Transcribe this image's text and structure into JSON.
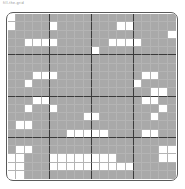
{
  "caption": {
    "text": "fill-the-grid"
  },
  "grid": {
    "columns": 20,
    "rows": 20,
    "block_size": 5,
    "filled_color": "#a9a9a9",
    "empty_color": "#ffffff",
    "gridline_color": "#b4b4b4",
    "block_line_color": "#3a3a3a",
    "border_color": "#5a5a5a",
    "cells": [
      [
        0,
        1,
        1,
        1,
        1,
        1,
        1,
        1,
        1,
        1,
        1,
        1,
        1,
        1,
        1,
        1,
        1,
        1,
        1,
        1
      ],
      [
        0,
        1,
        1,
        1,
        1,
        0,
        1,
        1,
        1,
        1,
        1,
        1,
        1,
        0,
        0,
        1,
        1,
        1,
        1,
        1
      ],
      [
        1,
        1,
        1,
        1,
        1,
        1,
        1,
        1,
        1,
        1,
        1,
        1,
        1,
        1,
        1,
        1,
        1,
        1,
        1,
        0
      ],
      [
        1,
        1,
        0,
        0,
        0,
        0,
        1,
        1,
        1,
        1,
        1,
        1,
        0,
        0,
        0,
        0,
        1,
        1,
        1,
        1
      ],
      [
        1,
        1,
        1,
        1,
        1,
        1,
        1,
        1,
        1,
        1,
        0,
        1,
        1,
        1,
        1,
        1,
        1,
        1,
        1,
        1
      ],
      [
        1,
        1,
        1,
        1,
        1,
        1,
        1,
        1,
        1,
        1,
        1,
        1,
        1,
        1,
        1,
        1,
        1,
        1,
        1,
        1
      ],
      [
        1,
        1,
        1,
        1,
        1,
        1,
        1,
        1,
        1,
        1,
        1,
        1,
        1,
        1,
        1,
        1,
        1,
        1,
        1,
        1
      ],
      [
        1,
        1,
        1,
        0,
        0,
        0,
        1,
        1,
        1,
        1,
        1,
        1,
        1,
        1,
        1,
        1,
        0,
        0,
        1,
        1
      ],
      [
        1,
        1,
        0,
        1,
        1,
        1,
        1,
        1,
        1,
        1,
        1,
        1,
        1,
        1,
        1,
        0,
        1,
        1,
        1,
        1
      ],
      [
        1,
        1,
        1,
        1,
        1,
        1,
        1,
        1,
        1,
        1,
        1,
        1,
        1,
        1,
        1,
        1,
        1,
        0,
        0,
        1
      ],
      [
        1,
        1,
        1,
        0,
        0,
        1,
        1,
        1,
        1,
        1,
        1,
        1,
        1,
        1,
        1,
        1,
        0,
        0,
        1,
        1
      ],
      [
        1,
        1,
        0,
        1,
        1,
        0,
        1,
        1,
        1,
        1,
        1,
        1,
        1,
        1,
        1,
        1,
        1,
        1,
        0,
        1
      ],
      [
        1,
        1,
        1,
        1,
        1,
        1,
        1,
        1,
        1,
        0,
        0,
        1,
        1,
        1,
        1,
        1,
        1,
        0,
        1,
        1
      ],
      [
        1,
        0,
        0,
        1,
        1,
        1,
        1,
        1,
        1,
        1,
        1,
        1,
        1,
        1,
        1,
        1,
        1,
        1,
        1,
        1
      ],
      [
        1,
        1,
        1,
        1,
        1,
        1,
        1,
        0,
        0,
        0,
        0,
        0,
        1,
        1,
        1,
        1,
        0,
        0,
        1,
        1
      ],
      [
        1,
        1,
        1,
        1,
        1,
        1,
        1,
        1,
        1,
        1,
        1,
        1,
        1,
        1,
        1,
        1,
        1,
        1,
        1,
        1
      ],
      [
        1,
        0,
        0,
        1,
        1,
        1,
        1,
        1,
        1,
        1,
        1,
        1,
        1,
        1,
        1,
        1,
        1,
        1,
        0,
        0
      ],
      [
        0,
        0,
        1,
        1,
        1,
        0,
        0,
        0,
        0,
        0,
        0,
        0,
        0,
        1,
        1,
        1,
        1,
        1,
        0,
        0
      ],
      [
        0,
        0,
        1,
        1,
        1,
        0,
        0,
        0,
        0,
        0,
        0,
        0,
        0,
        0,
        0,
        1,
        1,
        1,
        1,
        1
      ],
      [
        0,
        0,
        1,
        1,
        1,
        1,
        1,
        1,
        1,
        1,
        1,
        1,
        1,
        1,
        1,
        1,
        1,
        1,
        1,
        1
      ]
    ]
  }
}
